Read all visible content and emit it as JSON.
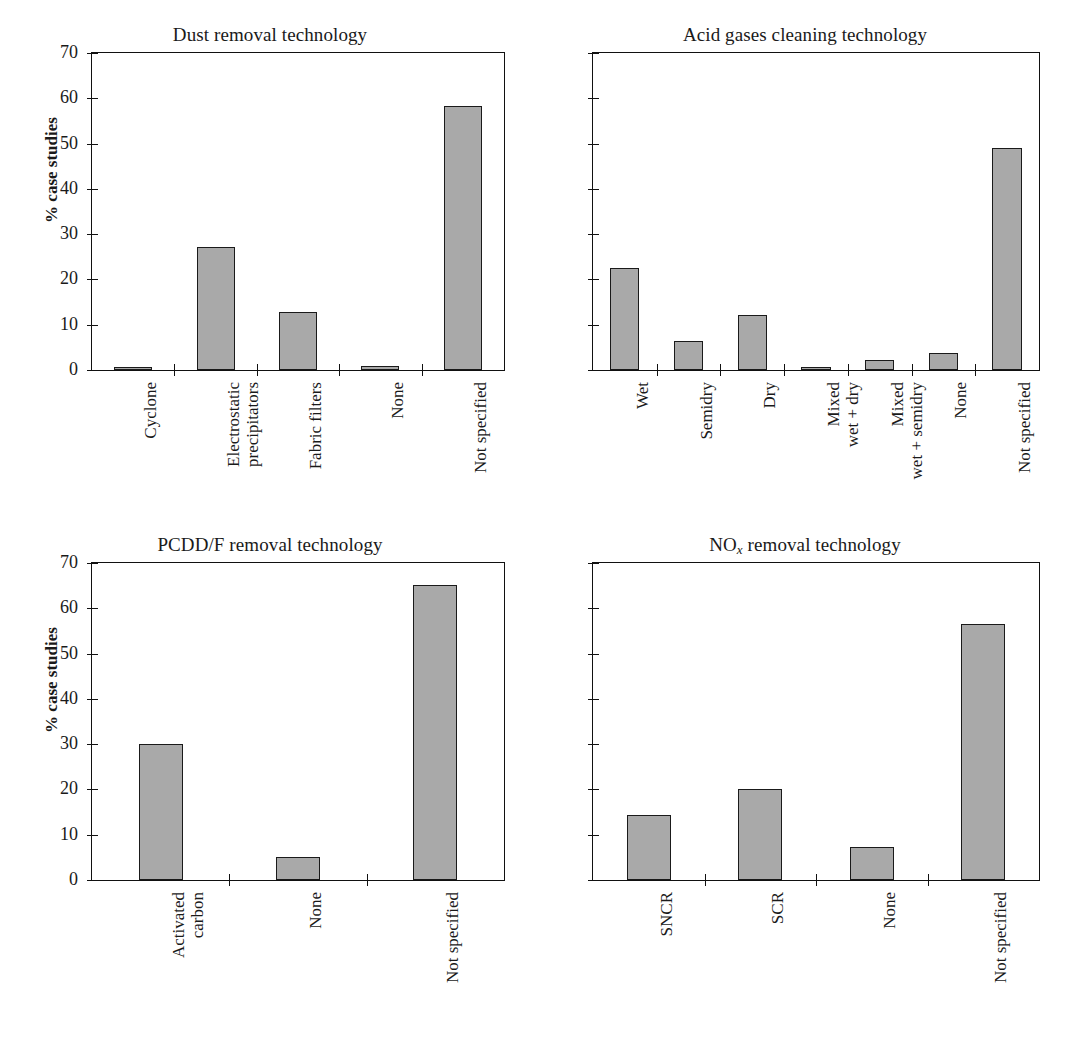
{
  "figure": {
    "ylabel": "% case studies",
    "axis": {
      "ymin": 0,
      "ymax": 70,
      "tick_step": 10
    }
  },
  "chart_data": [
    {
      "type": "bar",
      "id": "dust",
      "title": "Dust removal technology",
      "xlabel": "",
      "ylabel": "% case studies",
      "ylim": [
        0,
        70
      ],
      "yticks": [
        0,
        10,
        20,
        30,
        40,
        50,
        60,
        70
      ],
      "ytick_labels": [
        "0",
        "10",
        "20",
        "30",
        "40",
        "50",
        "60",
        "70"
      ],
      "show_ytick_labels": true,
      "grid": false,
      "legend": null,
      "categories": [
        "Cyclone",
        "Electrostatic\nprecipitators",
        "Fabric filters",
        "None",
        "Not specified"
      ],
      "values": [
        0.5,
        27.2,
        12.9,
        0.8,
        58.2
      ]
    },
    {
      "type": "bar",
      "id": "acid",
      "title": "Acid gases cleaning technology",
      "xlabel": "",
      "ylabel": "",
      "ylim": [
        0,
        70
      ],
      "yticks": [
        0,
        10,
        20,
        30,
        40,
        50,
        60,
        70
      ],
      "ytick_labels": [
        "",
        "",
        "",
        "",
        "",
        "",
        "",
        ""
      ],
      "show_ytick_labels": false,
      "grid": false,
      "legend": null,
      "categories": [
        "Wet",
        "Semidry",
        "Dry",
        "Mixed\nwet + dry",
        "Mixed\nwet + semidry",
        "None",
        "Not specified"
      ],
      "values": [
        22.5,
        6.5,
        12.2,
        0.5,
        2.2,
        3.8,
        49.0
      ]
    },
    {
      "type": "bar",
      "id": "pcdd",
      "title": "PCDD/F removal technology",
      "xlabel": "",
      "ylabel": "% case studies",
      "ylim": [
        0,
        70
      ],
      "yticks": [
        0,
        10,
        20,
        30,
        40,
        50,
        60,
        70
      ],
      "ytick_labels": [
        "0",
        "10",
        "20",
        "30",
        "40",
        "50",
        "60",
        "70"
      ],
      "show_ytick_labels": true,
      "grid": false,
      "legend": null,
      "categories": [
        "Activated\ncarbon",
        "None",
        "Not specified"
      ],
      "values": [
        30.0,
        5.0,
        65.2
      ]
    },
    {
      "type": "bar",
      "id": "nox",
      "title_rich": {
        "prefix": "NO",
        "sub": "x",
        "suffix": " removal technology"
      },
      "title": "NOx removal technology",
      "xlabel": "",
      "ylabel": "",
      "ylim": [
        0,
        70
      ],
      "yticks": [
        0,
        10,
        20,
        30,
        40,
        50,
        60,
        70
      ],
      "ytick_labels": [
        "",
        "",
        "",
        "",
        "",
        "",
        "",
        ""
      ],
      "show_ytick_labels": false,
      "grid": false,
      "legend": null,
      "categories": [
        "SNCR",
        "SCR",
        "None",
        "Not specified"
      ],
      "values": [
        14.3,
        20.2,
        7.3,
        56.6
      ]
    }
  ],
  "style": {
    "bar_fill": "#a9a9a9",
    "bar_stroke": "#1a1a1a",
    "axis_color": "#111111",
    "background": "#ffffff"
  }
}
